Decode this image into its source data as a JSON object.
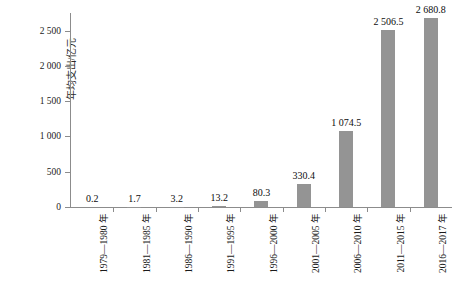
{
  "chart_data": {
    "type": "bar",
    "title": "",
    "xlabel": "",
    "ylabel": "年均支出/亿元",
    "ylim": [
      0,
      2750
    ],
    "grid": false,
    "legend": false,
    "orientation": "vertical",
    "bar_color": "#949494",
    "categories": [
      "1979—1980 年",
      "1981—1985 年",
      "1986—1990 年",
      "1991—1995 年",
      "1996—2000 年",
      "2001—2005 年",
      "2006—2010 年",
      "2011—2015 年",
      "2016—2017 年"
    ],
    "values": [
      0.2,
      1.7,
      3.2,
      13.2,
      80.3,
      330.4,
      1074.5,
      2506.5,
      2680.8
    ],
    "data_labels": [
      "0.2",
      "1.7",
      "3.2",
      "13.2",
      "80.3",
      "330.4",
      "1 074.5",
      "2 506.5",
      "2 680.8"
    ],
    "yticks": [
      0,
      500,
      1000,
      1500,
      2000,
      2500
    ],
    "ytick_labels": [
      "0",
      "500",
      "1 000",
      "1 500",
      "2 000",
      "2 500"
    ]
  }
}
